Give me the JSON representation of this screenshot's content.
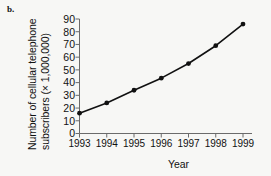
{
  "panel": {
    "label": "b."
  },
  "chart_data": {
    "type": "line",
    "title": "",
    "subtitle": "",
    "xlabel": "Year",
    "ylabel": "Number of cellular telephone subscribers (× 1,000,000)",
    "ylabel_line1": "Number of cellular telephone",
    "ylabel_line2": "subscribers (× 1,000,000)",
    "categories": [
      "1993",
      "1994",
      "1995",
      "1996",
      "1997",
      "1998",
      "1999"
    ],
    "x": [
      1993,
      1994,
      1995,
      1996,
      1997,
      1998,
      1999
    ],
    "values": [
      16,
      24,
      34,
      43.5,
      55,
      69,
      86
    ],
    "series": [
      {
        "name": "Cellular telephone subscribers",
        "values": [
          16,
          24,
          34,
          43.5,
          55,
          69,
          86
        ]
      }
    ],
    "ylim": [
      0,
      90
    ],
    "yticks": [
      0,
      10,
      20,
      30,
      40,
      50,
      60,
      70,
      80,
      90
    ],
    "ytick_labels": [
      "0",
      "10",
      "20",
      "30",
      "40",
      "50",
      "60",
      "70",
      "80",
      "90"
    ],
    "xticks": [
      1993,
      1994,
      1995,
      1996,
      1997,
      1998,
      1999
    ],
    "xtick_labels": [
      "1993",
      "1994",
      "1995",
      "1996",
      "1997",
      "1998",
      "1999"
    ],
    "grid": false,
    "legend": false,
    "legend_position": "none",
    "marker": "filled-circle",
    "line_color": "#111111",
    "marker_color": "#111111",
    "background_color": "#f7f7f5",
    "axis_color": "#6b6b6b"
  }
}
